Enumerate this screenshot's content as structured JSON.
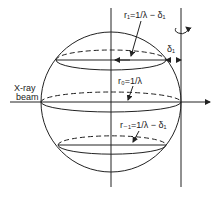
{
  "diagram": {
    "labels": {
      "r1": "r₁=1/λ − δ₁",
      "r0": "r₀=1/λ",
      "rm1": "r₋₁=1/λ − δ₁",
      "delta": "δ₁",
      "xray_line1": "X-ray",
      "xray_line2": "beam"
    },
    "colors": {
      "ink": "#222222",
      "background": "#ffffff"
    }
  }
}
